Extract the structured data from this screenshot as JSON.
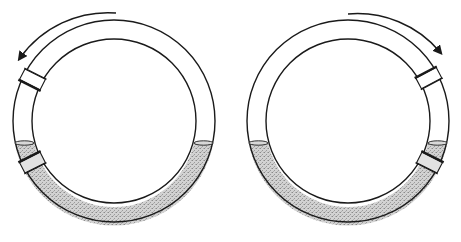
{
  "figure": {
    "colors": {
      "stroke": "#1a1a1a",
      "liquid": "#c8c8c8",
      "background": "#ffffff"
    },
    "panels": [
      {
        "id": "left",
        "rotation": "counterclockwise",
        "center": [
          114,
          121
        ],
        "outer_radius": 101,
        "inner_radius": 82,
        "liquid_level_y": 143,
        "plugs_angle_deg": [
          207,
          153
        ]
      },
      {
        "id": "right",
        "rotation": "clockwise",
        "center": [
          348,
          121
        ],
        "outer_radius": 101,
        "inner_radius": 82,
        "liquid_level_y": 143,
        "plugs_angle_deg": [
          -28,
          27
        ]
      }
    ]
  }
}
